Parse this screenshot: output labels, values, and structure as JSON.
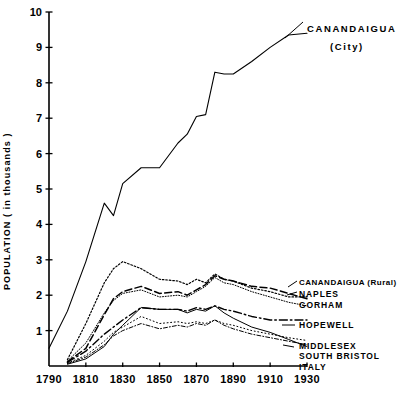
{
  "chart_data": {
    "type": "line",
    "title": "",
    "xlabel": "",
    "ylabel": "POPULATION ( in thousands )",
    "xlim": [
      1790,
      1930
    ],
    "ylim": [
      0,
      10
    ],
    "grid": false,
    "legend_position": "right-inline-annotations",
    "xticks": [
      "1790",
      "1810",
      "1830",
      "1850",
      "1870",
      "1890",
      "1910",
      "1930"
    ],
    "xtick_values": [
      1790,
      1810,
      1830,
      1850,
      1870,
      1890,
      1910,
      1930
    ],
    "yticks": [
      "1",
      "2",
      "3",
      "4",
      "5",
      "6",
      "7",
      "8",
      "9",
      "10"
    ],
    "ytick_values": [
      1,
      2,
      3,
      4,
      5,
      6,
      7,
      8,
      9,
      10
    ],
    "x": [
      1790,
      1800,
      1810,
      1820,
      1825,
      1830,
      1840,
      1850,
      1860,
      1865,
      1870,
      1875,
      1880,
      1885,
      1890,
      1900,
      1910,
      1920,
      1930
    ],
    "series": [
      {
        "name": "CANANDAIGUA (City)",
        "label_line1": "CANANDAIGUA",
        "label_line2": "(City)",
        "style": "solid",
        "values": [
          0.5,
          1.55,
          2.95,
          4.6,
          4.25,
          5.15,
          5.6,
          5.6,
          6.3,
          6.55,
          7.05,
          7.1,
          8.3,
          8.25,
          8.25,
          8.6,
          9.0,
          9.35,
          9.4
        ]
      },
      {
        "name": "CANANDAIGUA (Rural)",
        "label_line1": "CANANDAIGUA (Rural)",
        "style": "dotted",
        "values": [
          null,
          0.18,
          1.2,
          2.35,
          2.75,
          2.95,
          2.75,
          2.45,
          2.4,
          2.3,
          2.45,
          2.35,
          2.6,
          2.45,
          2.4,
          2.2,
          2.1,
          1.95,
          1.95
        ]
      },
      {
        "name": "NAPLES",
        "label_line1": "NAPLES",
        "style": "dashed",
        "values": [
          null,
          0.12,
          0.5,
          1.45,
          1.9,
          2.1,
          2.25,
          2.05,
          2.1,
          2.0,
          2.15,
          2.3,
          2.55,
          2.45,
          2.4,
          2.25,
          2.2,
          2.05,
          1.9
        ]
      },
      {
        "name": "GORHAM",
        "label_line1": "GORHAM",
        "style": "dotted-fine",
        "values": [
          null,
          0.14,
          0.65,
          1.5,
          1.85,
          2.05,
          2.15,
          1.95,
          2.0,
          1.95,
          2.1,
          2.25,
          2.5,
          2.35,
          2.3,
          2.1,
          1.95,
          1.8,
          1.7
        ]
      },
      {
        "name": "HOPEWELL",
        "label_line1": "HOPEWELL",
        "style": "dash-dot",
        "values": [
          null,
          0.1,
          0.42,
          0.9,
          1.1,
          1.3,
          1.65,
          1.6,
          1.6,
          1.55,
          1.65,
          1.6,
          1.7,
          1.6,
          1.55,
          1.4,
          1.3,
          1.3,
          1.3
        ]
      },
      {
        "name": "MIDDLESEX",
        "label_line1": "MIDDLESEX",
        "style": "dotted-sparse",
        "values": [
          null,
          0.08,
          0.3,
          0.7,
          0.95,
          1.1,
          1.4,
          1.2,
          1.25,
          1.2,
          1.25,
          1.2,
          1.3,
          1.2,
          1.15,
          1.0,
          0.9,
          0.8,
          0.72
        ]
      },
      {
        "name": "SOUTH BRISTOL",
        "label_line1": "SOUTH BRISTOL",
        "style": "dash-dot-fine",
        "values": [
          null,
          0.07,
          0.25,
          0.6,
          0.85,
          1.0,
          1.2,
          1.05,
          1.15,
          1.1,
          1.2,
          1.15,
          1.3,
          1.15,
          1.05,
          0.9,
          0.8,
          0.7,
          0.6
        ]
      },
      {
        "name": "ITALY",
        "label_line1": "ITALY",
        "style": "solid-thin",
        "values": [
          null,
          0.05,
          0.2,
          0.55,
          0.9,
          1.15,
          1.65,
          1.6,
          1.6,
          1.5,
          1.6,
          1.55,
          1.7,
          1.5,
          1.35,
          1.1,
          0.95,
          0.75,
          0.55
        ]
      }
    ]
  },
  "axes": {
    "y_title": "POPULATION ( in thousands )"
  },
  "annotations": {
    "city_label_1": "CANANDAIGUA",
    "city_label_2": "(City)",
    "rural_label": "CANANDAIGUA (Rural)",
    "naples_label": "NAPLES",
    "gorham_label": "GORHAM",
    "hopewell_label": "HOPEWELL",
    "middlesex_label": "MIDDLESEX",
    "south_bristol_label": "SOUTH BRISTOL",
    "italy_label": "ITALY"
  },
  "colors": {
    "ink": "#000000",
    "background": "#ffffff"
  }
}
